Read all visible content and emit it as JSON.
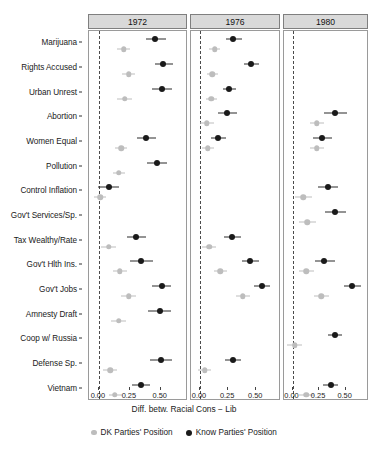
{
  "chart_data": {
    "type": "scatter",
    "subtype": "dot-and-whisker coefficient plot (faceted)",
    "title": "",
    "xlabel": "Diff. betw. Racial Cons − Lib",
    "ylabel": "",
    "xlim": [
      -0.08,
      0.72
    ],
    "xticks": [
      0.0,
      0.25,
      0.5
    ],
    "xticklabels": [
      "0.00",
      "0.25",
      "0.50"
    ],
    "grid": false,
    "zero_reference_line": 0.0,
    "legend_position": "bottom",
    "facet_variable": "year",
    "facets": [
      "1972",
      "1976",
      "1980"
    ],
    "categories": [
      "Marijuana",
      "Rights Accused",
      "Urban Unrest",
      "Abortion",
      "Women Equal",
      "Pollution",
      "Control Inflation",
      "Gov't Services/Sp.",
      "Tax Wealthy/Rate",
      "Gov't Hlth Ins.",
      "Gov't Jobs",
      "Amnesty Draft",
      "Coop w/ Russia",
      "Defense Sp.",
      "Vietnam"
    ],
    "series": [
      {
        "name": "DK Parties' Position",
        "color": "#bdbdbd",
        "points": {
          "1972": [
            {
              "category": "Marijuana",
              "estimate": 0.2,
              "low": 0.15,
              "high": 0.25
            },
            {
              "category": "Rights Accused",
              "estimate": 0.24,
              "low": 0.19,
              "high": 0.29
            },
            {
              "category": "Urban Unrest",
              "estimate": 0.21,
              "low": 0.15,
              "high": 0.27
            },
            {
              "category": "Abortion",
              "estimate": null,
              "low": null,
              "high": null
            },
            {
              "category": "Women Equal",
              "estimate": 0.18,
              "low": 0.13,
              "high": 0.23
            },
            {
              "category": "Pollution",
              "estimate": 0.16,
              "low": 0.11,
              "high": 0.21
            },
            {
              "category": "Control Inflation",
              "estimate": 0.01,
              "low": -0.04,
              "high": 0.06
            },
            {
              "category": "Gov't Services/Sp.",
              "estimate": null,
              "low": null,
              "high": null
            },
            {
              "category": "Tax Wealthy/Rate",
              "estimate": 0.08,
              "low": 0.02,
              "high": 0.14
            },
            {
              "category": "Gov't Hlth Ins.",
              "estimate": 0.17,
              "low": 0.11,
              "high": 0.23
            },
            {
              "category": "Gov't Jobs",
              "estimate": 0.24,
              "low": 0.18,
              "high": 0.3
            },
            {
              "category": "Amnesty Draft",
              "estimate": 0.16,
              "low": 0.1,
              "high": 0.22
            },
            {
              "category": "Coop w/ Russia",
              "estimate": null,
              "low": null,
              "high": null
            },
            {
              "category": "Defense Sp.",
              "estimate": 0.09,
              "low": 0.03,
              "high": 0.15
            },
            {
              "category": "Vietnam",
              "estimate": 0.13,
              "low": 0.08,
              "high": 0.19
            }
          ],
          "1976": [
            {
              "category": "Marijuana",
              "estimate": 0.13,
              "low": 0.08,
              "high": 0.18
            },
            {
              "category": "Rights Accused",
              "estimate": 0.11,
              "low": 0.06,
              "high": 0.16
            },
            {
              "category": "Urban Unrest",
              "estimate": 0.1,
              "low": 0.05,
              "high": 0.15
            },
            {
              "category": "Abortion",
              "estimate": 0.06,
              "low": 0.0,
              "high": 0.12
            },
            {
              "category": "Women Equal",
              "estimate": 0.07,
              "low": 0.02,
              "high": 0.12
            },
            {
              "category": "Pollution",
              "estimate": null,
              "low": null,
              "high": null
            },
            {
              "category": "Control Inflation",
              "estimate": null,
              "low": null,
              "high": null
            },
            {
              "category": "Gov't Services/Sp.",
              "estimate": null,
              "low": null,
              "high": null
            },
            {
              "category": "Tax Wealthy/Rate",
              "estimate": 0.08,
              "low": 0.02,
              "high": 0.14
            },
            {
              "category": "Gov't Hlth Ins.",
              "estimate": 0.18,
              "low": 0.12,
              "high": 0.24
            },
            {
              "category": "Gov't Jobs",
              "estimate": 0.38,
              "low": 0.32,
              "high": 0.44
            },
            {
              "category": "Amnesty Draft",
              "estimate": null,
              "low": null,
              "high": null
            },
            {
              "category": "Coop w/ Russia",
              "estimate": null,
              "low": null,
              "high": null
            },
            {
              "category": "Defense Sp.",
              "estimate": 0.04,
              "low": -0.02,
              "high": 0.1
            },
            {
              "category": "Vietnam",
              "estimate": null,
              "low": null,
              "high": null
            }
          ],
          "1980": [
            {
              "category": "Marijuana",
              "estimate": null,
              "low": null,
              "high": null
            },
            {
              "category": "Rights Accused",
              "estimate": null,
              "low": null,
              "high": null
            },
            {
              "category": "Urban Unrest",
              "estimate": null,
              "low": null,
              "high": null
            },
            {
              "category": "Abortion",
              "estimate": 0.23,
              "low": 0.16,
              "high": 0.3
            },
            {
              "category": "Women Equal",
              "estimate": 0.23,
              "low": 0.16,
              "high": 0.3
            },
            {
              "category": "Pollution",
              "estimate": null,
              "low": null,
              "high": null
            },
            {
              "category": "Control Inflation",
              "estimate": 0.1,
              "low": 0.02,
              "high": 0.18
            },
            {
              "category": "Gov't Services/Sp.",
              "estimate": 0.14,
              "low": 0.06,
              "high": 0.22
            },
            {
              "category": "Tax Wealthy/Rate",
              "estimate": null,
              "low": null,
              "high": null
            },
            {
              "category": "Gov't Hlth Ins.",
              "estimate": 0.13,
              "low": 0.06,
              "high": 0.2
            },
            {
              "category": "Gov't Jobs",
              "estimate": 0.27,
              "low": 0.2,
              "high": 0.34
            },
            {
              "category": "Amnesty Draft",
              "estimate": null,
              "low": null,
              "high": null
            },
            {
              "category": "Coop w/ Russia",
              "estimate": 0.02,
              "low": -0.05,
              "high": 0.09
            },
            {
              "category": "Defense Sp.",
              "estimate": null,
              "low": null,
              "high": null
            },
            {
              "category": "Vietnam",
              "estimate": 0.13,
              "low": 0.06,
              "high": 0.2
            }
          ]
        }
      },
      {
        "name": "Know Parties' Position",
        "color": "#1a1a1a",
        "points": {
          "1972": [
            {
              "category": "Marijuana",
              "estimate": 0.45,
              "low": 0.38,
              "high": 0.54
            },
            {
              "category": "Rights Accused",
              "estimate": 0.52,
              "low": 0.45,
              "high": 0.6
            },
            {
              "category": "Urban Unrest",
              "estimate": 0.51,
              "low": 0.43,
              "high": 0.59
            },
            {
              "category": "Abortion",
              "estimate": null,
              "low": null,
              "high": null
            },
            {
              "category": "Women Equal",
              "estimate": 0.38,
              "low": 0.31,
              "high": 0.46
            },
            {
              "category": "Pollution",
              "estimate": 0.47,
              "low": 0.39,
              "high": 0.55
            },
            {
              "category": "Control Inflation",
              "estimate": 0.08,
              "low": -0.01,
              "high": 0.16
            },
            {
              "category": "Gov't Services/Sp.",
              "estimate": null,
              "low": null,
              "high": null
            },
            {
              "category": "Tax Wealthy/Rate",
              "estimate": 0.3,
              "low": 0.23,
              "high": 0.38
            },
            {
              "category": "Gov't Hlth Ins.",
              "estimate": 0.34,
              "low": 0.25,
              "high": 0.44
            },
            {
              "category": "Gov't Jobs",
              "estimate": 0.51,
              "low": 0.43,
              "high": 0.58
            },
            {
              "category": "Amnesty Draft",
              "estimate": 0.49,
              "low": 0.4,
              "high": 0.58
            },
            {
              "category": "Coop w/ Russia",
              "estimate": null,
              "low": null,
              "high": null
            },
            {
              "category": "Defense Sp.",
              "estimate": 0.5,
              "low": 0.41,
              "high": 0.59
            },
            {
              "category": "Vietnam",
              "estimate": 0.34,
              "low": 0.27,
              "high": 0.41
            }
          ],
          "1976": [
            {
              "category": "Marijuana",
              "estimate": 0.29,
              "low": 0.23,
              "high": 0.37
            },
            {
              "category": "Rights Accused",
              "estimate": 0.45,
              "low": 0.39,
              "high": 0.52
            },
            {
              "category": "Urban Unrest",
              "estimate": 0.26,
              "low": 0.2,
              "high": 0.32
            },
            {
              "category": "Abortion",
              "estimate": 0.24,
              "low": 0.16,
              "high": 0.33
            },
            {
              "category": "Women Equal",
              "estimate": 0.16,
              "low": 0.1,
              "high": 0.23
            },
            {
              "category": "Pollution",
              "estimate": null,
              "low": null,
              "high": null
            },
            {
              "category": "Control Inflation",
              "estimate": null,
              "low": null,
              "high": null
            },
            {
              "category": "Gov't Services/Sp.",
              "estimate": null,
              "low": null,
              "high": null
            },
            {
              "category": "Tax Wealthy/Rate",
              "estimate": 0.28,
              "low": 0.21,
              "high": 0.36
            },
            {
              "category": "Gov't Hlth Ins.",
              "estimate": 0.44,
              "low": 0.37,
              "high": 0.52
            },
            {
              "category": "Gov't Jobs",
              "estimate": 0.55,
              "low": 0.48,
              "high": 0.62
            },
            {
              "category": "Amnesty Draft",
              "estimate": null,
              "low": null,
              "high": null
            },
            {
              "category": "Coop w/ Russia",
              "estimate": null,
              "low": null,
              "high": null
            },
            {
              "category": "Defense Sp.",
              "estimate": 0.29,
              "low": 0.22,
              "high": 0.36
            },
            {
              "category": "Vietnam",
              "estimate": null,
              "low": null,
              "high": null
            }
          ],
          "1980": [
            {
              "category": "Marijuana",
              "estimate": null,
              "low": null,
              "high": null
            },
            {
              "category": "Rights Accused",
              "estimate": null,
              "low": null,
              "high": null
            },
            {
              "category": "Urban Unrest",
              "estimate": null,
              "low": null,
              "high": null
            },
            {
              "category": "Abortion",
              "estimate": 0.4,
              "low": 0.3,
              "high": 0.51
            },
            {
              "category": "Women Equal",
              "estimate": 0.28,
              "low": 0.19,
              "high": 0.37
            },
            {
              "category": "Pollution",
              "estimate": null,
              "low": null,
              "high": null
            },
            {
              "category": "Control Inflation",
              "estimate": 0.33,
              "low": 0.24,
              "high": 0.43
            },
            {
              "category": "Gov't Services/Sp.",
              "estimate": 0.4,
              "low": 0.31,
              "high": 0.5
            },
            {
              "category": "Tax Wealthy/Rate",
              "estimate": null,
              "low": null,
              "high": null
            },
            {
              "category": "Gov't Hlth Ins.",
              "estimate": 0.3,
              "low": 0.21,
              "high": 0.4
            },
            {
              "category": "Gov't Jobs",
              "estimate": 0.56,
              "low": 0.48,
              "high": 0.64
            },
            {
              "category": "Amnesty Draft",
              "estimate": null,
              "low": null,
              "high": null
            },
            {
              "category": "Coop w/ Russia",
              "estimate": 0.4,
              "low": 0.33,
              "high": 0.47
            },
            {
              "category": "Defense Sp.",
              "estimate": null,
              "low": null,
              "high": null
            },
            {
              "category": "Vietnam",
              "estimate": 0.36,
              "low": 0.29,
              "high": 0.43
            }
          ]
        }
      }
    ],
    "legend": [
      {
        "label": "DK Parties' Position",
        "color": "#bdbdbd",
        "marker": "circle"
      },
      {
        "label": "Know Parties' Position",
        "color": "#1a1a1a",
        "marker": "circle"
      }
    ]
  },
  "style": {
    "strip_fill": "#d9d9d9",
    "panel_border": "#9a9a9a",
    "zero_line": "#4a4a4a",
    "background": "#ffffff"
  }
}
